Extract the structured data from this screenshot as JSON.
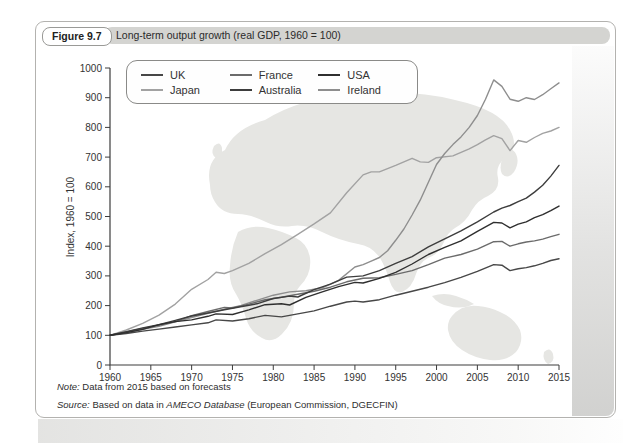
{
  "figure": {
    "label": "Figure 9.7",
    "title": "Long-term output growth (real GDP, 1960 = 100)"
  },
  "note": {
    "label": "Note:",
    "text": " Data from 2015 based on forecasts"
  },
  "source": {
    "label": "Source:",
    "pre": " Based on data in ",
    "emphasis": "AMECO Database",
    "post": " (European Commission, DGECFIN)"
  },
  "colors": {
    "title_bar_bg": "#d4d4d1",
    "card_border": "#b3b2af",
    "axis": "#3c3c3c",
    "tick_text": "#333333",
    "map_fill": "#e6e6e3",
    "legend_border": "#8a8a88"
  },
  "chart_data": {
    "type": "line",
    "title": "Long-term output growth (real GDP, 1960 = 100)",
    "xlabel": "",
    "ylabel": "Index, 1960 = 100",
    "xlim": [
      1960,
      2015
    ],
    "ylim": [
      0,
      1000
    ],
    "x_ticks": [
      1960,
      1965,
      1970,
      1975,
      1980,
      1985,
      1990,
      1995,
      2000,
      2005,
      2010,
      2015
    ],
    "y_ticks": [
      0,
      100,
      200,
      300,
      400,
      500,
      600,
      700,
      800,
      900,
      1000
    ],
    "grid": false,
    "legend_position": "top-left",
    "legend_columns": 3,
    "background_decoration": "world-map",
    "series": [
      {
        "name": "UK",
        "color": "#474747",
        "points": [
          [
            1960,
            100
          ],
          [
            1962,
            106
          ],
          [
            1964,
            114
          ],
          [
            1966,
            121
          ],
          [
            1968,
            128
          ],
          [
            1970,
            135
          ],
          [
            1972,
            142
          ],
          [
            1973,
            152
          ],
          [
            1975,
            148
          ],
          [
            1977,
            156
          ],
          [
            1979,
            167
          ],
          [
            1981,
            162
          ],
          [
            1983,
            172
          ],
          [
            1985,
            182
          ],
          [
            1987,
            198
          ],
          [
            1989,
            212
          ],
          [
            1990,
            215
          ],
          [
            1991,
            212
          ],
          [
            1993,
            220
          ],
          [
            1995,
            235
          ],
          [
            1997,
            248
          ],
          [
            1999,
            262
          ],
          [
            2001,
            277
          ],
          [
            2003,
            295
          ],
          [
            2005,
            315
          ],
          [
            2007,
            338
          ],
          [
            2008,
            336
          ],
          [
            2009,
            318
          ],
          [
            2010,
            324
          ],
          [
            2011,
            328
          ],
          [
            2012,
            334
          ],
          [
            2013,
            342
          ],
          [
            2014,
            352
          ],
          [
            2015,
            358
          ]
        ]
      },
      {
        "name": "France",
        "color": "#6b6b6b",
        "points": [
          [
            1960,
            100
          ],
          [
            1962,
            111
          ],
          [
            1964,
            123
          ],
          [
            1966,
            134
          ],
          [
            1968,
            146
          ],
          [
            1970,
            166
          ],
          [
            1972,
            180
          ],
          [
            1974,
            194
          ],
          [
            1975,
            192
          ],
          [
            1977,
            205
          ],
          [
            1979,
            220
          ],
          [
            1981,
            228
          ],
          [
            1983,
            238
          ],
          [
            1985,
            248
          ],
          [
            1987,
            262
          ],
          [
            1989,
            280
          ],
          [
            1991,
            292
          ],
          [
            1993,
            294
          ],
          [
            1995,
            305
          ],
          [
            1997,
            318
          ],
          [
            1999,
            338
          ],
          [
            2001,
            360
          ],
          [
            2003,
            372
          ],
          [
            2005,
            390
          ],
          [
            2007,
            415
          ],
          [
            2008,
            416
          ],
          [
            2009,
            400
          ],
          [
            2010,
            408
          ],
          [
            2011,
            414
          ],
          [
            2012,
            418
          ],
          [
            2013,
            424
          ],
          [
            2014,
            432
          ],
          [
            2015,
            440
          ]
        ]
      },
      {
        "name": "USA",
        "color": "#2f2f2f",
        "points": [
          [
            1960,
            100
          ],
          [
            1962,
            109
          ],
          [
            1964,
            120
          ],
          [
            1966,
            136
          ],
          [
            1968,
            146
          ],
          [
            1970,
            152
          ],
          [
            1972,
            164
          ],
          [
            1973,
            172
          ],
          [
            1975,
            170
          ],
          [
            1977,
            186
          ],
          [
            1979,
            203
          ],
          [
            1981,
            206
          ],
          [
            1982,
            202
          ],
          [
            1984,
            228
          ],
          [
            1986,
            246
          ],
          [
            1988,
            264
          ],
          [
            1990,
            278
          ],
          [
            1991,
            276
          ],
          [
            1993,
            292
          ],
          [
            1995,
            312
          ],
          [
            1997,
            340
          ],
          [
            1999,
            372
          ],
          [
            2001,
            396
          ],
          [
            2003,
            418
          ],
          [
            2005,
            450
          ],
          [
            2007,
            480
          ],
          [
            2008,
            478
          ],
          [
            2009,
            462
          ],
          [
            2010,
            474
          ],
          [
            2011,
            482
          ],
          [
            2012,
            496
          ],
          [
            2013,
            506
          ],
          [
            2014,
            520
          ],
          [
            2015,
            535
          ]
        ]
      },
      {
        "name": "Japan",
        "color": "#a2a2a2",
        "points": [
          [
            1960,
            100
          ],
          [
            1962,
            118
          ],
          [
            1964,
            140
          ],
          [
            1966,
            168
          ],
          [
            1968,
            205
          ],
          [
            1970,
            255
          ],
          [
            1972,
            288
          ],
          [
            1973,
            312
          ],
          [
            1974,
            308
          ],
          [
            1975,
            318
          ],
          [
            1977,
            342
          ],
          [
            1979,
            375
          ],
          [
            1981,
            405
          ],
          [
            1983,
            440
          ],
          [
            1985,
            475
          ],
          [
            1987,
            512
          ],
          [
            1989,
            580
          ],
          [
            1991,
            640
          ],
          [
            1992,
            650
          ],
          [
            1993,
            650
          ],
          [
            1995,
            672
          ],
          [
            1997,
            696
          ],
          [
            1998,
            684
          ],
          [
            1999,
            682
          ],
          [
            2000,
            698
          ],
          [
            2002,
            704
          ],
          [
            2004,
            728
          ],
          [
            2005,
            742
          ],
          [
            2006,
            758
          ],
          [
            2007,
            772
          ],
          [
            2008,
            762
          ],
          [
            2009,
            722
          ],
          [
            2010,
            756
          ],
          [
            2011,
            750
          ],
          [
            2012,
            766
          ],
          [
            2013,
            780
          ],
          [
            2014,
            788
          ],
          [
            2015,
            800
          ]
        ]
      },
      {
        "name": "Australia",
        "color": "#3d3d3d",
        "points": [
          [
            1960,
            100
          ],
          [
            1962,
            112
          ],
          [
            1964,
            125
          ],
          [
            1966,
            136
          ],
          [
            1968,
            150
          ],
          [
            1970,
            165
          ],
          [
            1972,
            175
          ],
          [
            1974,
            186
          ],
          [
            1976,
            196
          ],
          [
            1978,
            206
          ],
          [
            1980,
            224
          ],
          [
            1982,
            232
          ],
          [
            1983,
            229
          ],
          [
            1985,
            254
          ],
          [
            1987,
            272
          ],
          [
            1989,
            296
          ],
          [
            1991,
            300
          ],
          [
            1993,
            318
          ],
          [
            1995,
            342
          ],
          [
            1997,
            365
          ],
          [
            1999,
            398
          ],
          [
            2001,
            425
          ],
          [
            2003,
            452
          ],
          [
            2005,
            482
          ],
          [
            2007,
            515
          ],
          [
            2008,
            528
          ],
          [
            2009,
            537
          ],
          [
            2010,
            550
          ],
          [
            2011,
            562
          ],
          [
            2012,
            582
          ],
          [
            2013,
            605
          ],
          [
            2014,
            636
          ],
          [
            2015,
            672
          ]
        ]
      },
      {
        "name": "Ireland",
        "color": "#8e8e8e",
        "points": [
          [
            1960,
            100
          ],
          [
            1962,
            108
          ],
          [
            1964,
            120
          ],
          [
            1966,
            130
          ],
          [
            1968,
            145
          ],
          [
            1970,
            160
          ],
          [
            1972,
            174
          ],
          [
            1974,
            188
          ],
          [
            1976,
            200
          ],
          [
            1978,
            218
          ],
          [
            1980,
            235
          ],
          [
            1982,
            246
          ],
          [
            1984,
            250
          ],
          [
            1986,
            260
          ],
          [
            1988,
            285
          ],
          [
            1990,
            330
          ],
          [
            1991,
            338
          ],
          [
            1992,
            350
          ],
          [
            1993,
            362
          ],
          [
            1994,
            385
          ],
          [
            1995,
            420
          ],
          [
            1996,
            458
          ],
          [
            1997,
            505
          ],
          [
            1998,
            555
          ],
          [
            1999,
            615
          ],
          [
            2000,
            675
          ],
          [
            2001,
            712
          ],
          [
            2002,
            742
          ],
          [
            2003,
            768
          ],
          [
            2004,
            800
          ],
          [
            2005,
            840
          ],
          [
            2006,
            895
          ],
          [
            2007,
            960
          ],
          [
            2008,
            938
          ],
          [
            2009,
            895
          ],
          [
            2010,
            888
          ],
          [
            2011,
            900
          ],
          [
            2012,
            894
          ],
          [
            2013,
            910
          ],
          [
            2014,
            930
          ],
          [
            2015,
            950
          ]
        ]
      }
    ]
  }
}
